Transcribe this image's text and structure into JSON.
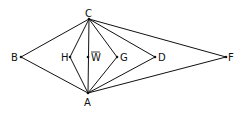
{
  "diagram": {
    "type": "geometric-graph",
    "points": [
      {
        "id": "C",
        "label": "C",
        "x": 89,
        "y": 19,
        "lx": 85,
        "ly": 17
      },
      {
        "id": "A",
        "label": "A",
        "x": 88,
        "y": 93,
        "lx": 84,
        "ly": 106
      },
      {
        "id": "B",
        "label": "B",
        "x": 21,
        "y": 57,
        "lx": 11,
        "ly": 61
      },
      {
        "id": "H",
        "label": "H",
        "x": 70,
        "y": 57,
        "lx": 61,
        "ly": 61
      },
      {
        "id": "W",
        "label": "W",
        "x": 88,
        "y": 57,
        "lx": 91,
        "ly": 61,
        "overline": true
      },
      {
        "id": "G",
        "label": "G",
        "x": 117,
        "y": 57,
        "lx": 120,
        "ly": 61
      },
      {
        "id": "D",
        "label": "D",
        "x": 155,
        "y": 57,
        "lx": 158,
        "ly": 61
      },
      {
        "id": "F",
        "label": "F",
        "x": 226,
        "y": 57,
        "lx": 228,
        "ly": 61
      }
    ],
    "edges": [
      [
        "C",
        "B"
      ],
      [
        "B",
        "A"
      ],
      [
        "C",
        "H"
      ],
      [
        "H",
        "A"
      ],
      [
        "C",
        "A"
      ],
      [
        "C",
        "G"
      ],
      [
        "G",
        "A"
      ],
      [
        "C",
        "D"
      ],
      [
        "D",
        "A"
      ],
      [
        "C",
        "F"
      ],
      [
        "F",
        "A"
      ]
    ],
    "colors": {
      "line": "#111111",
      "background": "#ffffff"
    }
  }
}
